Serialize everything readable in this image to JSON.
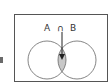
{
  "diagram": {
    "type": "venn",
    "label": "A ∩ B",
    "set_a": "A",
    "operator": "∩",
    "set_b": "B",
    "highlighted_region": "intersection",
    "colors": {
      "border": "#555555",
      "circle_stroke": "#666666",
      "intersection_fill": "#c8c8c8",
      "arrow": "#222222"
    }
  }
}
